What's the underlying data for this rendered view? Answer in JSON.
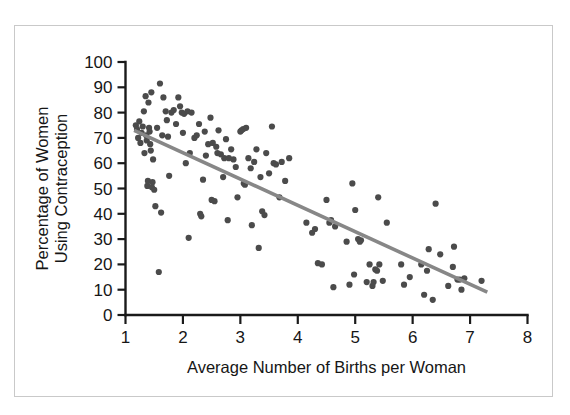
{
  "chart_data": {
    "type": "scatter",
    "title": "",
    "xlabel": "Average Number of Births per Woman",
    "ylabel_line1": "Percentage of Women",
    "ylabel_line2": "Using Contraception",
    "xlim": [
      1,
      8
    ],
    "ylim": [
      0,
      100
    ],
    "xticks": [
      1,
      2,
      3,
      4,
      5,
      6,
      7,
      8
    ],
    "yticks": [
      0,
      10,
      20,
      30,
      40,
      50,
      60,
      70,
      80,
      90,
      100
    ],
    "xtick_labels": [
      "1",
      "2",
      "3",
      "4",
      "5",
      "6",
      "7",
      "8"
    ],
    "ytick_labels": [
      "0",
      "10",
      "20",
      "30",
      "40",
      "50",
      "60",
      "70",
      "80",
      "90",
      "100"
    ],
    "grid": false,
    "legend": false,
    "point_color": "#4b4b4b",
    "point_radius": 3.1,
    "trend_line": {
      "color": "#878787",
      "x": [
        1.15,
        7.3
      ],
      "y": [
        73.0,
        9.0
      ]
    },
    "points": [
      [
        1.18,
        75.0
      ],
      [
        1.2,
        73.5
      ],
      [
        1.22,
        70.0
      ],
      [
        1.24,
        76.5
      ],
      [
        1.26,
        68.0
      ],
      [
        1.28,
        72.0
      ],
      [
        1.3,
        74.5
      ],
      [
        1.32,
        80.5
      ],
      [
        1.33,
        64.0
      ],
      [
        1.35,
        86.5
      ],
      [
        1.36,
        71.0
      ],
      [
        1.37,
        69.0
      ],
      [
        1.38,
        51.0
      ],
      [
        1.39,
        53.0
      ],
      [
        1.4,
        84.0
      ],
      [
        1.41,
        74.0
      ],
      [
        1.42,
        72.5
      ],
      [
        1.43,
        67.5
      ],
      [
        1.44,
        65.0
      ],
      [
        1.45,
        88.0
      ],
      [
        1.46,
        50.5
      ],
      [
        1.47,
        52.5
      ],
      [
        1.48,
        61.5
      ],
      [
        1.5,
        49.5
      ],
      [
        1.52,
        43.0
      ],
      [
        1.55,
        74.0
      ],
      [
        1.58,
        17.0
      ],
      [
        1.6,
        91.5
      ],
      [
        1.62,
        40.5
      ],
      [
        1.64,
        71.0
      ],
      [
        1.66,
        86.0
      ],
      [
        1.7,
        80.5
      ],
      [
        1.72,
        77.0
      ],
      [
        1.74,
        70.5
      ],
      [
        1.76,
        55.0
      ],
      [
        1.8,
        80.0
      ],
      [
        1.84,
        81.0
      ],
      [
        1.88,
        75.5
      ],
      [
        1.92,
        86.0
      ],
      [
        1.95,
        82.5
      ],
      [
        1.98,
        80.0
      ],
      [
        2.0,
        72.0
      ],
      [
        2.02,
        79.5
      ],
      [
        2.05,
        60.0
      ],
      [
        2.08,
        80.5
      ],
      [
        2.1,
        30.5
      ],
      [
        2.12,
        64.0
      ],
      [
        2.15,
        80.0
      ],
      [
        2.2,
        70.0
      ],
      [
        2.24,
        71.0
      ],
      [
        2.28,
        75.5
      ],
      [
        2.3,
        40.0
      ],
      [
        2.32,
        39.0
      ],
      [
        2.35,
        53.5
      ],
      [
        2.38,
        72.5
      ],
      [
        2.4,
        63.0
      ],
      [
        2.44,
        67.5
      ],
      [
        2.48,
        78.0
      ],
      [
        2.5,
        45.5
      ],
      [
        2.52,
        68.0
      ],
      [
        2.55,
        45.0
      ],
      [
        2.58,
        66.5
      ],
      [
        2.6,
        64.0
      ],
      [
        2.62,
        73.0
      ],
      [
        2.66,
        63.5
      ],
      [
        2.7,
        54.5
      ],
      [
        2.72,
        62.0
      ],
      [
        2.75,
        69.5
      ],
      [
        2.78,
        37.5
      ],
      [
        2.8,
        62.0
      ],
      [
        2.84,
        65.5
      ],
      [
        2.88,
        61.5
      ],
      [
        2.92,
        58.5
      ],
      [
        2.95,
        46.5
      ],
      [
        3.0,
        72.5
      ],
      [
        3.02,
        73.0
      ],
      [
        3.05,
        73.5
      ],
      [
        3.06,
        52.0
      ],
      [
        3.08,
        51.5
      ],
      [
        3.1,
        74.0
      ],
      [
        3.14,
        62.0
      ],
      [
        3.18,
        58.0
      ],
      [
        3.2,
        35.5
      ],
      [
        3.24,
        60.5
      ],
      [
        3.28,
        65.5
      ],
      [
        3.32,
        26.5
      ],
      [
        3.35,
        54.5
      ],
      [
        3.38,
        41.0
      ],
      [
        3.42,
        39.5
      ],
      [
        3.45,
        64.0
      ],
      [
        3.5,
        56.0
      ],
      [
        3.55,
        74.5
      ],
      [
        3.58,
        60.0
      ],
      [
        3.62,
        59.5
      ],
      [
        3.68,
        46.5
      ],
      [
        3.72,
        60.5
      ],
      [
        3.78,
        53.0
      ],
      [
        3.85,
        62.0
      ],
      [
        4.15,
        36.5
      ],
      [
        4.25,
        32.5
      ],
      [
        4.3,
        34.0
      ],
      [
        4.35,
        20.5
      ],
      [
        4.42,
        20.0
      ],
      [
        4.5,
        45.5
      ],
      [
        4.55,
        36.5
      ],
      [
        4.58,
        37.5
      ],
      [
        4.62,
        11.0
      ],
      [
        4.65,
        35.0
      ],
      [
        4.85,
        29.0
      ],
      [
        4.9,
        12.0
      ],
      [
        4.95,
        52.0
      ],
      [
        4.98,
        16.0
      ],
      [
        5.0,
        41.5
      ],
      [
        5.05,
        30.0
      ],
      [
        5.08,
        29.0
      ],
      [
        5.1,
        29.5
      ],
      [
        5.2,
        13.0
      ],
      [
        5.25,
        20.0
      ],
      [
        5.3,
        11.5
      ],
      [
        5.32,
        13.0
      ],
      [
        5.35,
        18.0
      ],
      [
        5.38,
        17.5
      ],
      [
        5.4,
        46.5
      ],
      [
        5.42,
        20.0
      ],
      [
        5.48,
        13.5
      ],
      [
        5.55,
        36.5
      ],
      [
        5.8,
        20.0
      ],
      [
        5.85,
        12.0
      ],
      [
        5.95,
        15.0
      ],
      [
        6.15,
        20.0
      ],
      [
        6.2,
        8.0
      ],
      [
        6.25,
        17.5
      ],
      [
        6.28,
        26.0
      ],
      [
        6.35,
        6.0
      ],
      [
        6.4,
        44.0
      ],
      [
        6.48,
        24.0
      ],
      [
        6.62,
        11.5
      ],
      [
        6.7,
        19.0
      ],
      [
        6.72,
        27.0
      ],
      [
        6.78,
        14.0
      ],
      [
        6.82,
        14.0
      ],
      [
        6.85,
        10.0
      ],
      [
        6.9,
        14.5
      ],
      [
        7.2,
        13.5
      ]
    ]
  },
  "figure": {
    "frame_color": "#c9c9c9",
    "background": "#ffffff"
  }
}
